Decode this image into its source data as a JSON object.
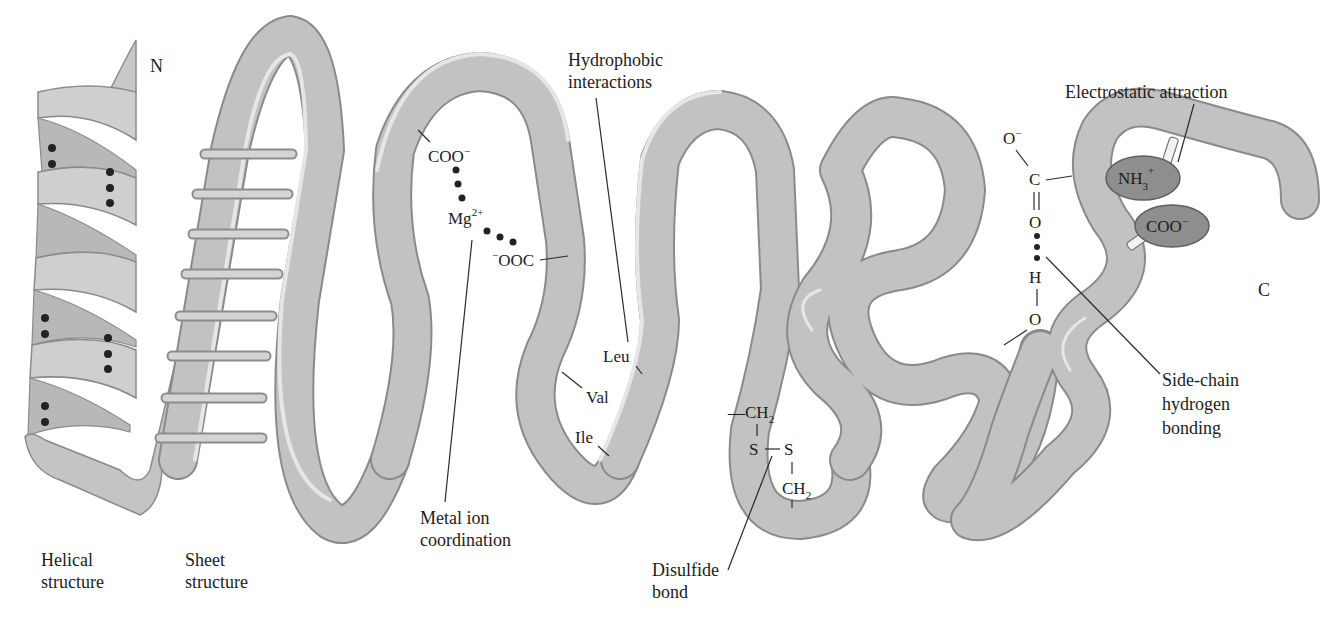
{
  "figure": {
    "colors": {
      "ribbon_fill": "#c2c2c2",
      "ribbon_edge": "#8a8a8a",
      "ribbon_highlight": "#e6e6e6",
      "ion_oval": "#8e8e8e",
      "text": "#1c1c1c",
      "background": "#ffffff"
    }
  },
  "termini": {
    "n_terminus": "N",
    "c_terminus": "C"
  },
  "structures": {
    "helical": {
      "line1": "Helical",
      "line2": "structure"
    },
    "sheet": {
      "line1": "Sheet",
      "line2": "structure"
    }
  },
  "metal_ion": {
    "caption_line1": "Metal ion",
    "caption_line2": "coordination",
    "ligand1": "COO",
    "ligand1_charge": "−",
    "ion": "Mg",
    "ion_charge": "2+",
    "ligand2_charge": "−",
    "ligand2": "OOC"
  },
  "hydrophobic": {
    "caption_line1": "Hydrophobic",
    "caption_line2": "interactions",
    "residues": [
      "Leu",
      "Val",
      "Ile"
    ]
  },
  "disulfide": {
    "caption_line1": "Disulfide",
    "caption_line2": "bond",
    "top_group": "—CH",
    "top_sub": "2",
    "s1": "S",
    "s2": "S",
    "bottom_group": "CH",
    "bottom_sub": "2"
  },
  "hydrogen_bond": {
    "caption_line1": "Side-chain",
    "caption_line2": "hydrogen",
    "caption_line3": "bonding",
    "atoms": {
      "o_minus": "O",
      "o_minus_charge": "−",
      "c": "C",
      "o_double": "O",
      "h": "H",
      "o_bottom": "O"
    }
  },
  "electrostatic": {
    "caption": "Electrostatic attraction",
    "cation": "NH",
    "cation_sub": "3",
    "cation_charge": "+",
    "anion": "COO",
    "anion_charge": "−"
  }
}
